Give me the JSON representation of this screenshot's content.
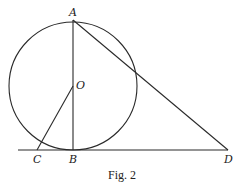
{
  "figure": {
    "caption": "Fig. 2",
    "points": {
      "A": {
        "label": "A",
        "x": 73,
        "y": 20
      },
      "O": {
        "label": "O",
        "x": 73,
        "y": 86
      },
      "B": {
        "label": "B",
        "x": 73,
        "y": 150
      },
      "C": {
        "label": "C",
        "x": 37,
        "y": 150
      },
      "D": {
        "label": "D",
        "x": 228,
        "y": 150
      }
    },
    "circle": {
      "center": "O",
      "radius": 64
    },
    "segments": [
      [
        "A",
        "B"
      ],
      [
        "A",
        "D"
      ],
      [
        "O",
        "C"
      ]
    ],
    "baseline": {
      "x1": 18,
      "x2": 228,
      "y": 150
    }
  }
}
